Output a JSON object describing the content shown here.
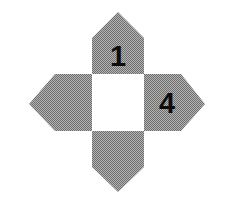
{
  "figure": {
    "canvas": {
      "width": 234,
      "height": 209,
      "background": "#ffffff"
    },
    "colors": {
      "arm_fill": "#9a9a9a",
      "arm_dither_dark": "#4d4d4d",
      "arm_dither_light": "#e8e8e8",
      "center_fill": "#ffffff",
      "number_color": "#0d0d0d",
      "background": "#ffffff"
    },
    "center": {
      "name": "center-square",
      "shape": "square",
      "x": 92,
      "y": 74,
      "width": 52,
      "height": 57,
      "label": ""
    },
    "arms": [
      {
        "id": "top",
        "name": "top-arm",
        "shape": "pentagon",
        "direction": "up",
        "label": "1",
        "apex": {
          "x": 118,
          "y": 12
        },
        "shoulder_y": 38,
        "points": "92,74 92,38 118,12 144,38 144,74",
        "label_x": 118,
        "label_y": 56
      },
      {
        "id": "right",
        "name": "right-arm",
        "shape": "pentagon",
        "direction": "right",
        "label": "4",
        "apex": {
          "x": 205,
          "y": 104
        },
        "shoulder_x": 181,
        "points": "144,74 181,74 205,104 181,131 144,131",
        "label_x": 167,
        "label_y": 103
      },
      {
        "id": "bottom",
        "name": "bottom-arm",
        "shape": "pentagon",
        "direction": "down",
        "label": "",
        "apex": {
          "x": 118,
          "y": 192
        },
        "shoulder_y": 167,
        "points": "92,131 144,131 144,167 118,192 92,167",
        "label_x": 118,
        "label_y": 150
      },
      {
        "id": "left",
        "name": "left-arm",
        "shape": "pentagon",
        "direction": "left",
        "label": "",
        "apex": {
          "x": 29,
          "y": 104
        },
        "shoulder_x": 55,
        "points": "92,74 92,131 55,131 29,104 55,74",
        "label_x": 66,
        "label_y": 103
      }
    ],
    "numbers": [
      {
        "value": "1",
        "arm": "top"
      },
      {
        "value": "4",
        "arm": "right"
      }
    ]
  }
}
